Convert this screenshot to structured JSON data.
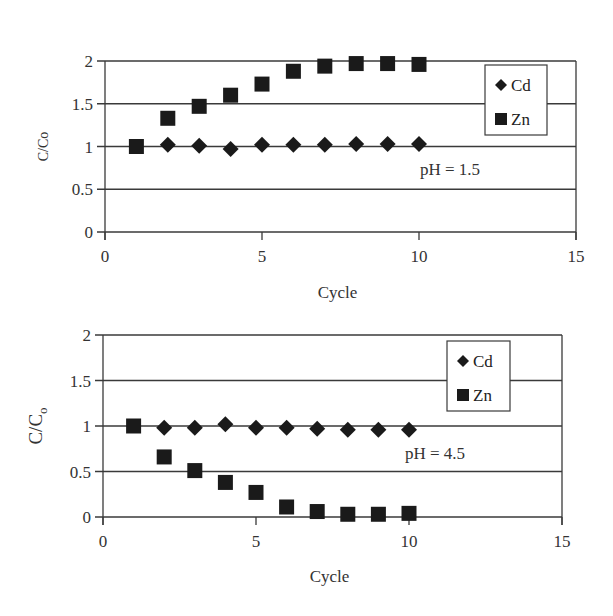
{
  "chart_data": [
    {
      "type": "scatter",
      "title": "",
      "xlabel": "Cycle",
      "ylabel": "C/Co",
      "xlim": [
        0,
        15
      ],
      "ylim": [
        0,
        2
      ],
      "x_ticks": [
        0,
        5,
        10,
        15
      ],
      "y_ticks": [
        0,
        0.5,
        1,
        1.5,
        2
      ],
      "x_tick_labels": [
        "0",
        "5",
        "10",
        "15"
      ],
      "y_tick_labels": [
        "0",
        "0.5",
        "1",
        "1.5",
        "2"
      ],
      "grid": "horizontal",
      "legend_position": "upper right",
      "annotation": "pH = 1.5",
      "x": [
        1,
        2,
        3,
        4,
        5,
        6,
        7,
        8,
        9,
        10
      ],
      "series": [
        {
          "name": "Cd",
          "marker": "diamond",
          "values": [
            null,
            1.02,
            1.01,
            0.97,
            1.02,
            1.02,
            1.02,
            1.03,
            1.03,
            1.03
          ]
        },
        {
          "name": "Zn",
          "marker": "square",
          "values": [
            1.0,
            1.33,
            1.47,
            1.6,
            1.73,
            1.88,
            1.94,
            1.97,
            1.97,
            1.96
          ]
        }
      ]
    },
    {
      "type": "scatter",
      "title": "",
      "xlabel": "Cycle",
      "ylabel": "C/C0",
      "xlim": [
        0,
        15
      ],
      "ylim": [
        0,
        2
      ],
      "x_ticks": [
        0,
        5,
        10,
        15
      ],
      "y_ticks": [
        0,
        0.5,
        1,
        1.5,
        2
      ],
      "x_tick_labels": [
        "0",
        "5",
        "10",
        "15"
      ],
      "y_tick_labels": [
        "0",
        "0.5",
        "1",
        "1.5",
        "2"
      ],
      "grid": "horizontal",
      "legend_position": "upper right",
      "annotation": "pH = 4.5",
      "x": [
        1,
        2,
        3,
        4,
        5,
        6,
        7,
        8,
        9,
        10
      ],
      "series": [
        {
          "name": "Cd",
          "marker": "diamond",
          "values": [
            null,
            0.98,
            0.98,
            1.02,
            0.98,
            0.98,
            0.97,
            0.96,
            0.96,
            0.96
          ]
        },
        {
          "name": "Zn",
          "marker": "square",
          "values": [
            1.0,
            0.66,
            0.51,
            0.38,
            0.27,
            0.11,
            0.06,
            0.03,
            0.03,
            0.04
          ]
        }
      ]
    }
  ],
  "charts": [
    {
      "xlabel": "Cycle",
      "ylabel_main": "C/Co",
      "ylabel_sub": "",
      "annotation": "pH = 1.5",
      "legend": [
        {
          "label": "Cd"
        },
        {
          "label": "Zn"
        }
      ]
    },
    {
      "xlabel": "Cycle",
      "ylabel_main": "C/C",
      "ylabel_sub": "o",
      "annotation": "pH = 4.5",
      "legend": [
        {
          "label": "Cd"
        },
        {
          "label": "Zn"
        }
      ]
    }
  ],
  "layout": [
    {
      "left": 105,
      "right": 576,
      "top": 61,
      "bottom": 232,
      "legend": {
        "x": 485,
        "y": 65,
        "w": 62,
        "h": 70
      },
      "annot": {
        "x": 420,
        "y": 175
      },
      "xlabel_y": 298,
      "ylabel_x": 48
    },
    {
      "left": 103,
      "right": 562,
      "top": 335,
      "bottom": 517,
      "legend": {
        "x": 447,
        "y": 341,
        "w": 63,
        "h": 70
      },
      "annot": {
        "x": 405,
        "y": 459
      },
      "xlabel_y": 582,
      "ylabel_x": 42
    }
  ]
}
